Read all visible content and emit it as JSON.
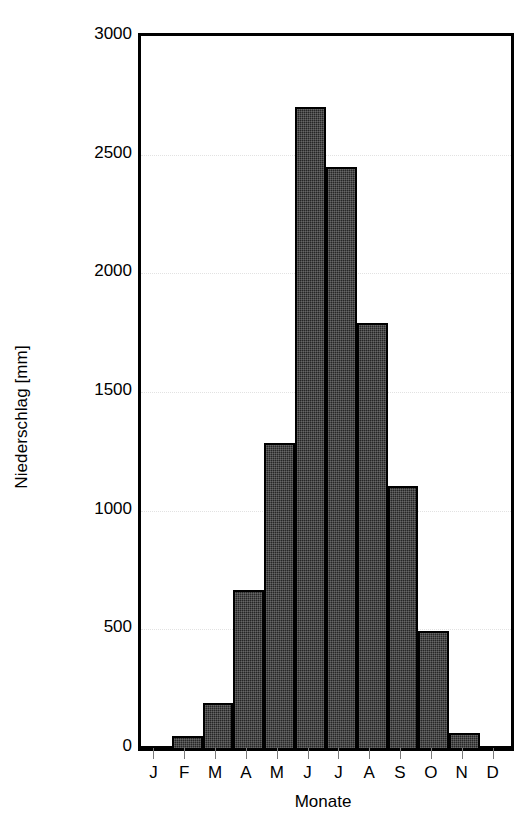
{
  "chart_data": {
    "type": "bar",
    "title": "",
    "xlabel": "Monate",
    "ylabel": "Niederschlag [mm]",
    "categories": [
      "J",
      "F",
      "M",
      "A",
      "M",
      "J",
      "J",
      "A",
      "S",
      "O",
      "N",
      "D"
    ],
    "values": [
      10,
      50,
      190,
      665,
      1285,
      2700,
      2450,
      1790,
      1105,
      495,
      65,
      10
    ],
    "ylim": [
      0,
      3000
    ],
    "yticks": [
      0,
      500,
      1000,
      1500,
      2000,
      2500,
      3000
    ],
    "ytick_labels": [
      "0",
      "500",
      "1000",
      "1500",
      "2000",
      "2500",
      "3000"
    ],
    "grid": true,
    "legend": null,
    "bar_color": "#262626",
    "bar_edge_color": "#000000",
    "grid_color": "#e2e2e2",
    "axis_color": "#000000"
  }
}
